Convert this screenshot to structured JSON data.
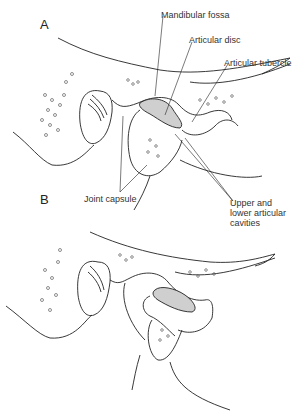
{
  "figure": {
    "panels": [
      {
        "id": "A",
        "label": "A"
      },
      {
        "id": "B",
        "label": "B"
      }
    ],
    "labels": {
      "mandibular_fossa": "Mandibular fossa",
      "articular_disc": "Articular disc",
      "articular_tubercle": "Articular tubercle",
      "joint_capsule": "Joint capsule",
      "cavities_line1": "Upper and",
      "cavities_line2": "lower articular",
      "cavities_line3": "cavities"
    },
    "colors": {
      "outline": "#222222",
      "disc_fill": "#cfcfcf",
      "background": "#ffffff"
    }
  }
}
